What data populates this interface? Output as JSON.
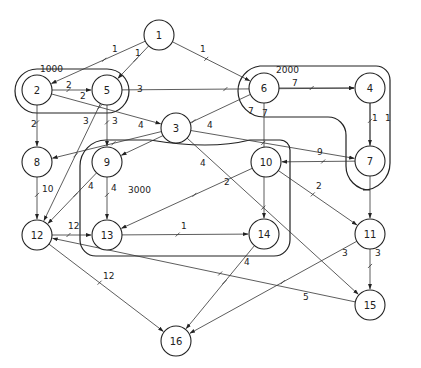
{
  "diagram": {
    "type": "weighted-directed-graph",
    "nodes": [
      {
        "id": "1",
        "x": 159,
        "y": 35
      },
      {
        "id": "2",
        "x": 37,
        "y": 90
      },
      {
        "id": "5",
        "x": 107,
        "y": 90
      },
      {
        "id": "6",
        "x": 264,
        "y": 88
      },
      {
        "id": "4",
        "x": 370,
        "y": 88
      },
      {
        "id": "3",
        "x": 176,
        "y": 128
      },
      {
        "id": "8",
        "x": 37,
        "y": 162
      },
      {
        "id": "9",
        "x": 107,
        "y": 162
      },
      {
        "id": "10",
        "x": 266,
        "y": 162
      },
      {
        "id": "7",
        "x": 370,
        "y": 161
      },
      {
        "id": "12",
        "x": 37,
        "y": 235
      },
      {
        "id": "13",
        "x": 107,
        "y": 235
      },
      {
        "id": "14",
        "x": 264,
        "y": 234
      },
      {
        "id": "11",
        "x": 370,
        "y": 234
      },
      {
        "id": "15",
        "x": 370,
        "y": 305
      },
      {
        "id": "16",
        "x": 176,
        "y": 341
      }
    ],
    "edges": [
      {
        "from": "1",
        "to": "2",
        "weight": "1",
        "lx": 112,
        "ly": 52
      },
      {
        "from": "1",
        "to": "5",
        "weight": "1",
        "lx": 135,
        "ly": 56
      },
      {
        "from": "1",
        "to": "6",
        "weight": "1",
        "lx": 200,
        "ly": 52
      },
      {
        "from": "2",
        "to": "5",
        "weight": "2",
        "lx": 66,
        "ly": 88
      },
      {
        "from": "2",
        "to": "3",
        "weight": "2",
        "lx": 80,
        "ly": 99
      },
      {
        "from": "2",
        "to": "8",
        "weight": "2",
        "lx": 31,
        "ly": 127
      },
      {
        "from": "5",
        "to": "4",
        "weight": "3",
        "lx": 137,
        "ly": 92
      },
      {
        "from": "5",
        "to": "9",
        "weight": "3",
        "lx": 112,
        "ly": 124
      },
      {
        "from": "5",
        "to": "12",
        "weight": "3",
        "lx": 83,
        "ly": 124
      },
      {
        "from": "6",
        "to": "4",
        "weight": "7",
        "lx": 292,
        "ly": 86
      },
      {
        "from": "6",
        "to": "9",
        "weight": "7",
        "lx": 248,
        "ly": 114
      },
      {
        "from": "6",
        "to": "14",
        "weight": "7",
        "lx": 262,
        "ly": 116
      },
      {
        "from": "3",
        "to": "8",
        "weight": "4",
        "lx": 138,
        "ly": 128
      },
      {
        "from": "3",
        "to": "7",
        "weight": "4",
        "lx": 207,
        "ly": 128
      },
      {
        "from": "3",
        "to": "15",
        "weight": "4",
        "lx": 200,
        "ly": 166
      },
      {
        "from": "4",
        "to": "7",
        "weight": "1",
        "lx": 372,
        "ly": 121
      },
      {
        "from": "4",
        "to": "11",
        "weight": "1",
        "lx": 385,
        "ly": 121
      },
      {
        "from": "7",
        "to": "10",
        "weight": "9",
        "lx": 317,
        "ly": 155
      },
      {
        "from": "8",
        "to": "12",
        "weight": "10",
        "lx": 42,
        "ly": 192
      },
      {
        "from": "9",
        "to": "12",
        "weight": "4",
        "lx": 88,
        "ly": 189
      },
      {
        "from": "9",
        "to": "13",
        "weight": "4",
        "lx": 111,
        "ly": 191
      },
      {
        "from": "10",
        "to": "13",
        "weight": "2",
        "lx": 224,
        "ly": 185
      },
      {
        "from": "10",
        "to": "11",
        "weight": "2",
        "lx": 316,
        "ly": 189
      },
      {
        "from": "12",
        "to": "13",
        "weight": "12",
        "lx": 68,
        "ly": 229
      },
      {
        "from": "13",
        "to": "14",
        "weight": "1",
        "lx": 181,
        "ly": 229
      },
      {
        "from": "14",
        "to": "16",
        "weight": "4",
        "lx": 244,
        "ly": 265
      },
      {
        "from": "11",
        "to": "16",
        "weight": "3",
        "lx": 342,
        "ly": 256
      },
      {
        "from": "11",
        "to": "15",
        "weight": "3",
        "lx": 375,
        "ly": 256
      },
      {
        "from": "12",
        "to": "16",
        "weight": "12",
        "lx": 103,
        "ly": 279
      },
      {
        "from": "15",
        "to": "12",
        "weight": "5",
        "lx": 303,
        "ly": 300
      }
    ],
    "clusters": [
      {
        "label": "1000",
        "lx": 40,
        "ly": 72
      },
      {
        "label": "2000",
        "lx": 276,
        "ly": 73
      },
      {
        "label": "3000",
        "lx": 128,
        "ly": 190
      }
    ]
  }
}
